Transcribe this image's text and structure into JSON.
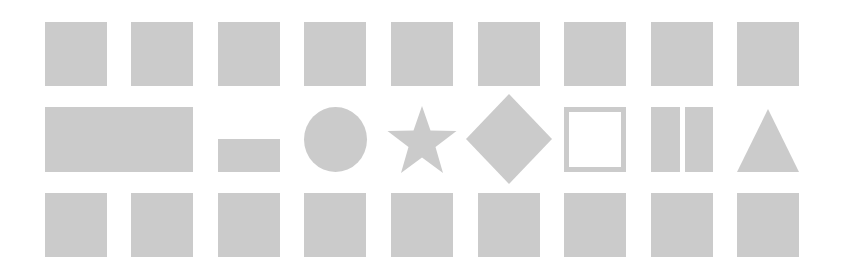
{
  "colors": {
    "shape_fill": "#cbcbcb",
    "background": "#ffffff"
  },
  "rows": [
    {
      "name": "top-row",
      "items": [
        {
          "type": "square"
        },
        {
          "type": "square"
        },
        {
          "type": "square"
        },
        {
          "type": "square"
        },
        {
          "type": "square"
        },
        {
          "type": "square"
        },
        {
          "type": "square"
        },
        {
          "type": "square"
        },
        {
          "type": "square"
        }
      ]
    },
    {
      "name": "middle-row",
      "items": [
        {
          "type": "wide-rectangle"
        },
        {
          "type": "small-rectangle"
        },
        {
          "type": "circle"
        },
        {
          "type": "star"
        },
        {
          "type": "diamond"
        },
        {
          "type": "hollow-square"
        },
        {
          "type": "two-bars"
        },
        {
          "type": "triangle"
        }
      ]
    },
    {
      "name": "bottom-row",
      "items": [
        {
          "type": "square"
        },
        {
          "type": "square"
        },
        {
          "type": "square"
        },
        {
          "type": "square"
        },
        {
          "type": "square"
        },
        {
          "type": "square"
        },
        {
          "type": "square"
        },
        {
          "type": "square"
        },
        {
          "type": "square"
        }
      ]
    }
  ]
}
